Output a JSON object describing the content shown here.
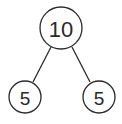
{
  "diagram": {
    "type": "number-bond",
    "root": {
      "value": "10"
    },
    "children": [
      {
        "value": "5"
      },
      {
        "value": "5"
      }
    ],
    "colors": {
      "stroke": "#2a2a2a",
      "background": "#ffffff"
    }
  }
}
